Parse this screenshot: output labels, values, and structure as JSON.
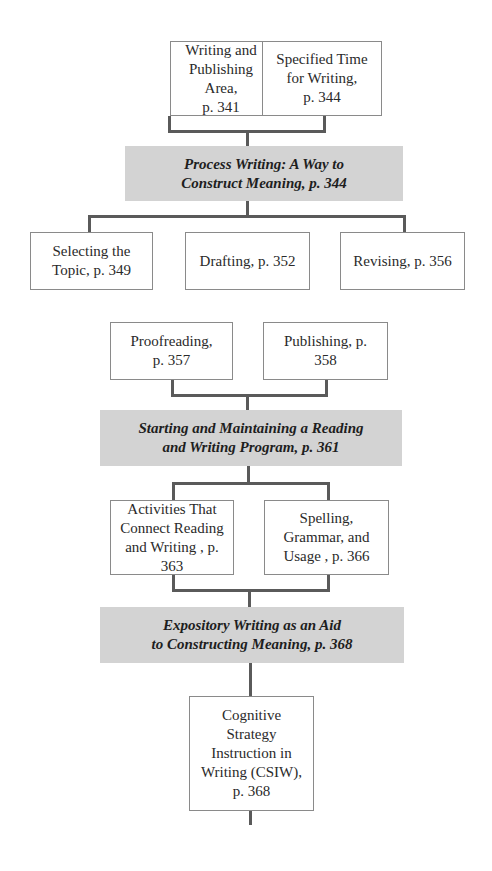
{
  "diagram": {
    "row1": [
      {
        "label": "Writing and\nPublishing Area,\np. 341"
      },
      {
        "label": "Specified Time\nfor Writing,\np. 344"
      }
    ],
    "band1": {
      "label": "Process Writing: A Way to\nConstruct Meaning, p. 344"
    },
    "row2": [
      {
        "label": "Selecting the\nTopic, p. 349"
      },
      {
        "label": "Drafting, p. 352"
      },
      {
        "label": "Revising, p. 356"
      }
    ],
    "row3": [
      {
        "label": "Proofreading,\np. 357"
      },
      {
        "label": "Publishing, p.\n358"
      }
    ],
    "band2": {
      "label": "Starting and Maintaining a Reading\nand Writing Program, p. 361"
    },
    "row4": [
      {
        "label": "Activities That\nConnect Reading\nand Writing , p. 363"
      },
      {
        "label": "Spelling,\nGrammar, and\nUsage , p. 366"
      }
    ],
    "band3": {
      "label": "Expository Writing as an Aid\nto Constructing Meaning, p. 368"
    },
    "row5": [
      {
        "label": "Cognitive\nStrategy\nInstruction in\nWriting (CSIW),\np. 368"
      }
    ]
  },
  "colors": {
    "band_fill": "#d3d3d3",
    "box_border": "#8a8a8a",
    "connector": "#5a5a5a"
  }
}
